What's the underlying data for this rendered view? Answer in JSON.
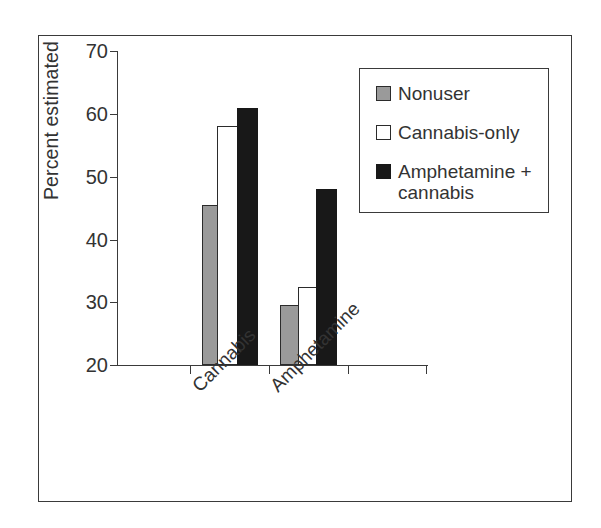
{
  "chart_data": {
    "type": "bar",
    "title": "",
    "subtitle": "",
    "xlabel": "",
    "ylabel": "Percent estimated",
    "categories": [
      "Cannabis",
      "Amphetamine"
    ],
    "series": [
      {
        "name": "Nonuser",
        "color": "#9a9a9a",
        "values": [
          45.5,
          29.5
        ]
      },
      {
        "name": "Cannabis-only",
        "color": "#ffffff",
        "values": [
          58.0,
          32.5
        ]
      },
      {
        "name": "Amphetamine + cannabis",
        "color": "#181818",
        "values": [
          61.0,
          48.0
        ]
      }
    ],
    "ylim": [
      20,
      70
    ],
    "yticks": [
      20,
      30,
      40,
      50,
      60,
      70
    ],
    "ytick_labels": [
      "20",
      "30",
      "40",
      "50",
      "60",
      "70"
    ],
    "grid": false,
    "legend_position": "top-right",
    "xtick_rotation": -45,
    "annotations": []
  },
  "legend": {
    "entries": [
      {
        "label": "Nonuser"
      },
      {
        "label": "Cannabis-only"
      },
      {
        "label": "Amphetamine +\ncannabis"
      }
    ]
  },
  "axis": {
    "y_label": "Percent estimated"
  }
}
